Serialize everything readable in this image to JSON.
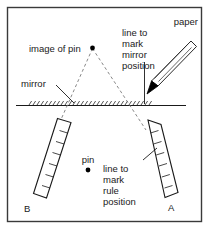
{
  "figure": {
    "border_color": "#3a3a3a",
    "line_color": "#1a1a1a",
    "dash_color": "#6e6e6e",
    "background": "#ffffff"
  },
  "labels": {
    "paper": "paper",
    "image_of_pin": "image of pin",
    "mirror": "mirror",
    "pin": "pin",
    "rule_a": "A",
    "rule_b": "B",
    "mirror_note_line1": "line to",
    "mirror_note_line2": "mark",
    "mirror_note_line3": "mirror",
    "mirror_note_line4": "position",
    "rule_note_line1": "line to",
    "rule_note_line2": "mark",
    "rule_note_line3": "rule",
    "rule_note_line4": "position"
  },
  "objects": {
    "mirror_line": "horizontal hatched mirror line",
    "ruler_a": "tilted rule marked A at lower right",
    "ruler_b": "tilted rule marked B at lower left",
    "pencil": "pencil marking the mirror position",
    "pin_dot": "solid dot for pin",
    "image_dot": "solid dot for image of pin",
    "rays": "dashed sight lines forming a V"
  }
}
